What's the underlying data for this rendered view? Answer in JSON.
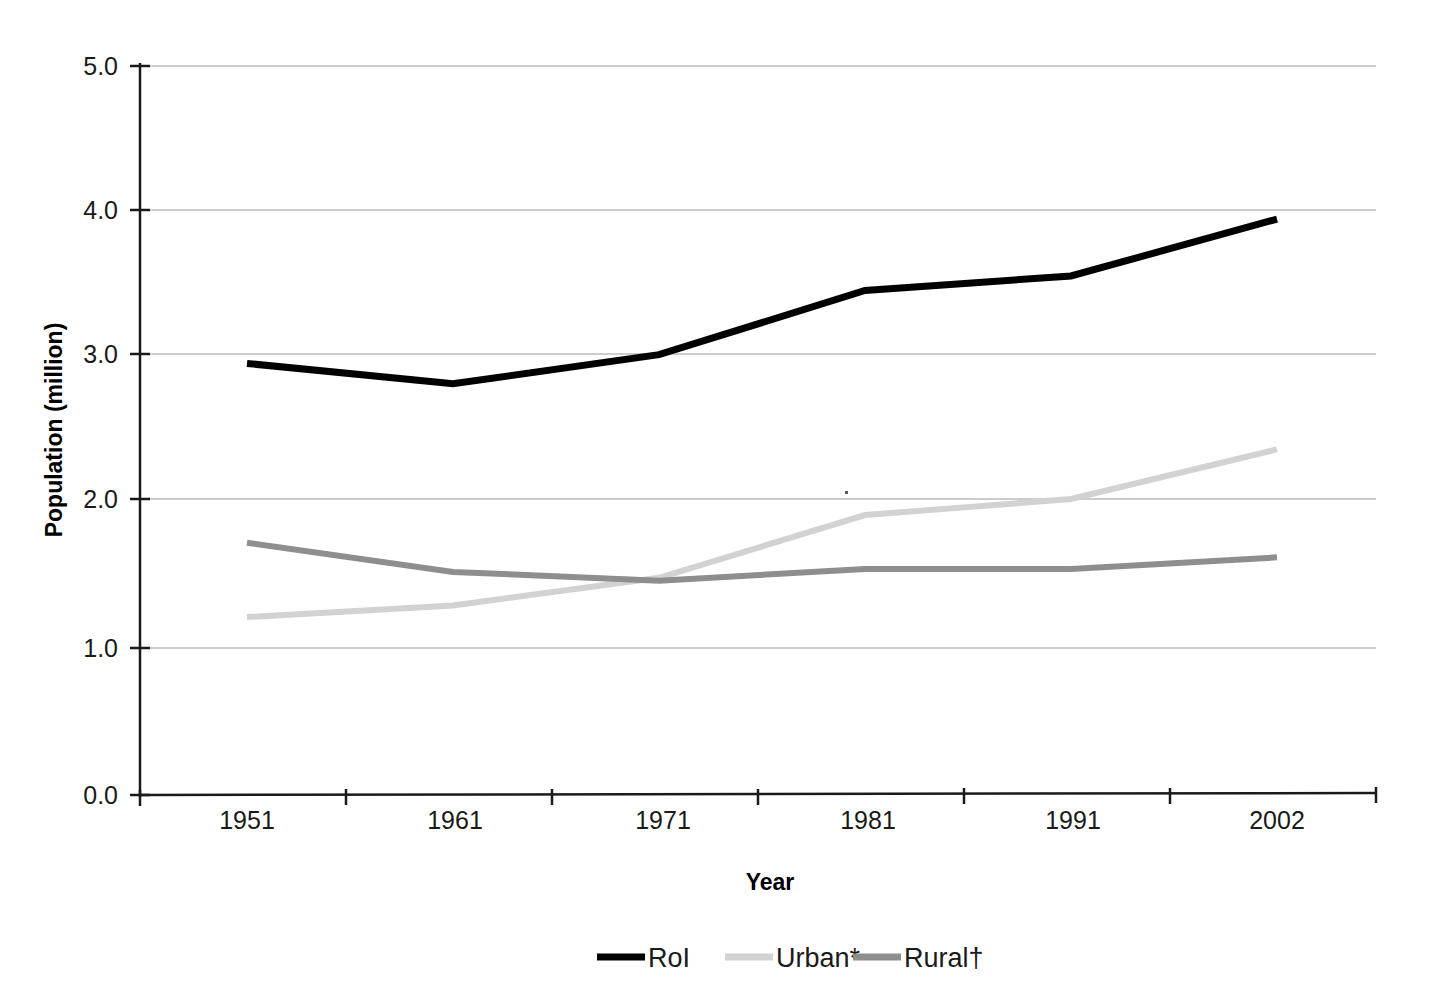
{
  "chart_data": {
    "type": "line",
    "title": "",
    "subtitle": "",
    "xlabel": "Year",
    "ylabel": "Population (million)",
    "categories": [
      "1951",
      "1961",
      "1971",
      "1981",
      "1991",
      "2002"
    ],
    "x": [
      1951,
      1961,
      1971,
      1981,
      1991,
      2002
    ],
    "series": [
      {
        "name": "RoI",
        "color": "#000000",
        "width": 7,
        "values": [
          2.96,
          2.82,
          3.02,
          3.46,
          3.56,
          3.95
        ]
      },
      {
        "name": "Urban*",
        "color": "#d2d2d2",
        "width": 6,
        "values": [
          1.22,
          1.3,
          1.49,
          1.92,
          2.03,
          2.37
        ]
      },
      {
        "name": "Rural†",
        "color": "#8e8e8e",
        "width": 6,
        "values": [
          1.73,
          1.53,
          1.47,
          1.55,
          1.55,
          1.63
        ]
      }
    ],
    "ylim": [
      0.0,
      5.0
    ],
    "yticks": [
      "0.0",
      "1.0",
      "2.0",
      "3.0",
      "4.0",
      "5.0"
    ],
    "ytick_values": [
      0.0,
      1.0,
      2.0,
      3.0,
      4.0,
      5.0
    ],
    "grid": true,
    "grid_axis": "y",
    "legend_position": "bottom",
    "legend_entries": [
      "RoI",
      "Urban*",
      "Rural†"
    ],
    "annotations": []
  },
  "axes": {
    "y_title": "Population (million)",
    "x_title": "Year",
    "y_tick_0": "0.0",
    "y_tick_1": "1.0",
    "y_tick_2": "2.0",
    "y_tick_3": "3.0",
    "y_tick_4": "4.0",
    "y_tick_5": "5.0",
    "x_tick_0": "1951",
    "x_tick_1": "1961",
    "x_tick_2": "1971",
    "x_tick_3": "1981",
    "x_tick_4": "1991",
    "x_tick_5": "2002"
  },
  "legend": {
    "item_0_label": "RoI",
    "item_1_label": "Urban*",
    "item_2_label": "Rural†"
  }
}
